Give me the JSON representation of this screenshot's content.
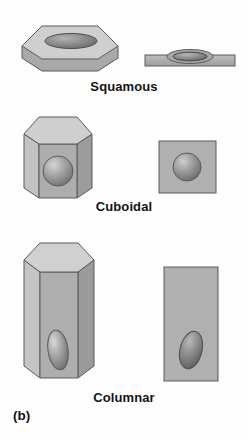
{
  "figure": {
    "panel_label": "(b)",
    "background_color": "#fefefe",
    "ink_color": "#141414",
    "palette": {
      "top_face": "#cfcfcf",
      "front_face": "#a9a9a9",
      "bevel_light": "#c2c2c2",
      "bevel_dark": "#9c9c9c",
      "outline": "#555555",
      "nucleus_light": "#d2d2d2",
      "nucleus_mid": "#9a9a9a",
      "nucleus_dark": "#6a6a6a"
    }
  },
  "rows": [
    {
      "label": "Squamous",
      "perspective_view": "flat-hexagonal-prism-with-elliptical-nucleus",
      "section_view": "thin-horizontal-slab-with-lens-shaped-bulging-nucleus",
      "nucleus_shape": "flattened-ellipse",
      "nucleus_position": "center"
    },
    {
      "label": "Cuboidal",
      "perspective_view": "cube-hexagonal-prism-with-spherical-nucleus",
      "section_view": "square-with-spherical-nucleus",
      "nucleus_shape": "sphere",
      "nucleus_position": "center"
    },
    {
      "label": "Columnar",
      "perspective_view": "tall-hexagonal-prism-with-oval-nucleus",
      "section_view": "tall-rectangle-with-oval-nucleus",
      "nucleus_shape": "elongated-oval",
      "nucleus_position": "basal-lower-third"
    }
  ]
}
